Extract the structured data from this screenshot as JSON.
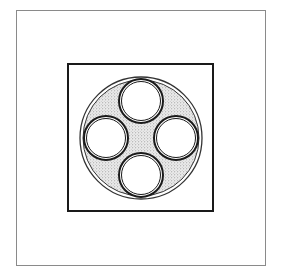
{
  "diagram": {
    "type": "cable-cross-section",
    "frame": {
      "outer_border": {
        "x": 16,
        "y": 10,
        "width": 249,
        "height": 255,
        "stroke": "#8a8a8a",
        "stroke_width": 1
      },
      "inner_square": {
        "x": 68,
        "y": 64,
        "width": 145,
        "height": 147,
        "stroke": "#1a1a1a",
        "stroke_width": 2
      }
    },
    "sheath": {
      "cx": 141,
      "cy": 138,
      "outer_radius": 61,
      "inner_radius": 58,
      "stroke": "#333333",
      "filler_color": "#d6d6d6",
      "filler_pattern": "stipple"
    },
    "conductors": [
      {
        "id": "top",
        "cx": 141,
        "cy": 101,
        "r": 22
      },
      {
        "id": "right",
        "cx": 176,
        "cy": 138,
        "r": 22
      },
      {
        "id": "bottom",
        "cx": 141,
        "cy": 175,
        "r": 22
      },
      {
        "id": "left",
        "cx": 106,
        "cy": 138,
        "r": 22
      }
    ],
    "conductor_style": {
      "outer_stroke_width": 2,
      "inner_ring_offset": 2.5,
      "inner_stroke_width": 1,
      "fill": "#ffffff",
      "stroke": "#1a1a1a"
    },
    "colors": {
      "background": "#ffffff",
      "line": "#1a1a1a",
      "stipple": "#9a9a9a"
    }
  }
}
